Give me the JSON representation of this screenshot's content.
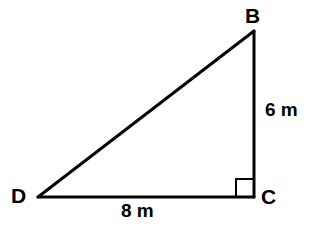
{
  "figure": {
    "kind": "right-triangle-diagram",
    "background_color": "#ffffff",
    "stroke_color": "#000000",
    "stroke_width": 3,
    "right_angle_marker_stroke_width": 2,
    "right_angle_at_vertex": "C"
  },
  "vertices": {
    "b": {
      "label": "B",
      "x": 254,
      "y": 31
    },
    "c": {
      "label": "C",
      "x": 254,
      "y": 197
    },
    "d": {
      "label": "D",
      "x": 38,
      "y": 197
    }
  },
  "sides": {
    "bc": {
      "label": "6 m",
      "value": 6,
      "unit": "m",
      "from": "B",
      "to": "C"
    },
    "dc": {
      "label": "8 m",
      "value": 8,
      "unit": "m",
      "from": "D",
      "to": "C"
    },
    "db": {
      "label": "",
      "from": "D",
      "to": "B"
    }
  },
  "right_angle_marker": {
    "name": "right-angle-square",
    "x": 236,
    "y": 179,
    "size": 17
  }
}
